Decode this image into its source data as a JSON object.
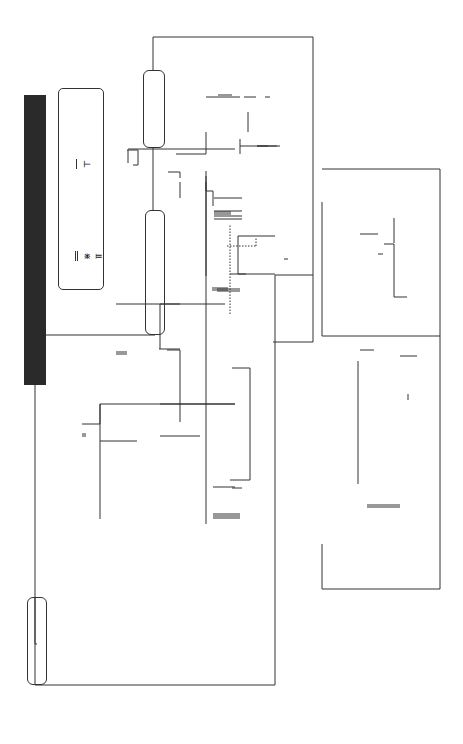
{
  "key": {
    "label": "Key",
    "items": [
      {
        "symbol": "double-line",
        "text": "lifemates"
      },
      {
        "symbol": "cross-line",
        "text": "twins"
      },
      {
        "symbol": "dotted-tee",
        "text": "adopted children"
      },
      {
        "symbol": "single-line",
        "text": "siblings"
      },
      {
        "symbol": "tee",
        "text": "offspring\nof lifemates"
      }
    ]
  },
  "families": {
    "savage": "SAVAGE",
    "daratrazanoff": "DARATRAZANOFF",
    "dubrinsky": "DUBRINSKY",
    "justicano": "JUSTICANO/BELANDRAKE"
  },
  "people": {
    "julian": "Julian\nSavage",
    "aidan": "Aidan",
    "desari": "Desari",
    "alexandria": "Alexandria\nHouton",
    "josh": "Josh",
    "darius": "Darius",
    "tempest": "Tempest\nTrine",
    "dimitri": "Dimitri\nTirunul",
    "skyler": "Skyler",
    "gabriel": "Gabriel",
    "francesca": "Francesca\nDel Ponce",
    "tamara": "Tamara",
    "alexandru": "Alexandru",
    "anya": "Anya",
    "anastasia": "Anastasia",
    "lucian": "Lucian",
    "jaxon": "Jaxon\nMontgomery",
    "raven": "Raven Whitney",
    "mikhail": "Mikhail",
    "savannah": "Savannah",
    "gregori": "Gregori\nDaratrazanoff",
    "stefan": "Stefan",
    "sarantha": "Sarantha",
    "vlad": "Vlad",
    "noelle": "Noelle",
    "jacques": "Jacques",
    "shea": "Shea O'Halloran",
    "diedre": "Diedre",
    "tienn": "Tienn",
    "vlad_belandrake": "Vlad\nBelandrake",
    "josef": "Josef",
    "eleanor": "Eleanor",
    "benjamin": "Benjamin",
    "byron": "Byron\nJusticano",
    "antonietta": "Antonietta\nScarletti"
  },
  "books": {
    "dark_challenge": "Dark Challenge",
    "dark_gold": "Dark Gold",
    "dark_fire": "Dark\nFire",
    "dark_wolf": "Dark Wolf",
    "dark_legend": "Dark\nLegend",
    "dark_guardian": "Dark\nGuardian",
    "dark_prince": "Dark Prince",
    "dark_magic": "Dark Magic",
    "dark_desire": "Dark Desire",
    "dark_symphony": "Dark\nSymphony",
    "scarletti_curse": "The Scarletti Curse"
  }
}
